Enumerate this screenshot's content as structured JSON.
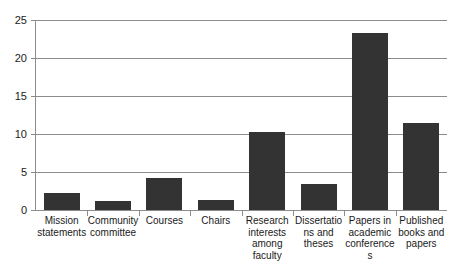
{
  "chart_data": {
    "type": "bar",
    "title": "",
    "subtitle": "",
    "xlabel": "",
    "ylabel": "",
    "ylim": [
      0,
      25
    ],
    "yticks": [
      "0",
      "5",
      "10",
      "15",
      "20",
      "25"
    ],
    "ytick_values": [
      0,
      5,
      10,
      15,
      20,
      25
    ],
    "grid": true,
    "legend": false,
    "legend_position": "none",
    "bar_color": "#333333",
    "grid_color": "#8c8c8c",
    "categories": [
      "Mission statements",
      "Community committee",
      "Courses",
      "Chairs",
      "Research interests among faculty",
      "Dissertations and theses",
      "Papers in academic conferences",
      "Published books and papers"
    ],
    "values": [
      2.2,
      1.2,
      4.2,
      1.3,
      10.3,
      3.4,
      23.3,
      11.5
    ]
  },
  "axis": {
    "y_tick_labels": [
      "25",
      "20",
      "15",
      "10",
      "5",
      "0"
    ]
  },
  "categories_display": [
    "Mission statements",
    "Community committee",
    "Courses",
    "Chairs",
    "Research interests among faculty",
    "Dissertations and theses",
    "Papers in academic conferences",
    "Published books and papers"
  ]
}
